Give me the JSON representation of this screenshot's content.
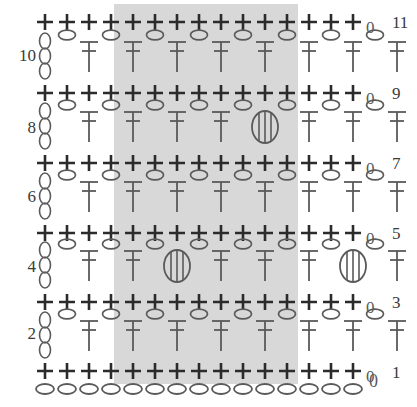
{
  "chart": {
    "type": "crochet-pattern-chart",
    "columns": 15,
    "rows_total": 11,
    "foundation_label": "0",
    "chain_end_label": "0",
    "repeat_band": {
      "x": 114,
      "y": 4,
      "width": 184,
      "height": 380,
      "color": "#d8d8d8",
      "meaning": "pattern repeat"
    },
    "row_labels_left": [
      {
        "label": "10",
        "x": 8,
        "y": 47
      },
      {
        "label": "8",
        "x": 8,
        "y": 119
      },
      {
        "label": "6",
        "x": 8,
        "y": 188
      },
      {
        "label": "4",
        "x": 8,
        "y": 258
      },
      {
        "label": "2",
        "x": 8,
        "y": 325
      }
    ],
    "row_labels_right": [
      {
        "label": "11",
        "x": 392,
        "y": 14
      },
      {
        "label": "9",
        "x": 392,
        "y": 85
      },
      {
        "label": "7",
        "x": 392,
        "y": 155
      },
      {
        "label": "5",
        "x": 392,
        "y": 225
      },
      {
        "label": "3",
        "x": 392,
        "y": 294
      },
      {
        "label": "1",
        "x": 392,
        "y": 364
      }
    ],
    "odd_rows": [
      {
        "number": 11,
        "y": 22,
        "symbol": "single-crochet",
        "count": 15,
        "turning_chain": "0"
      },
      {
        "number": 9,
        "y": 93,
        "symbol": "single-crochet",
        "count": 15,
        "turning_chain": "0"
      },
      {
        "number": 7,
        "y": 163,
        "symbol": "single-crochet",
        "count": 15,
        "turning_chain": "0"
      },
      {
        "number": 5,
        "y": 233,
        "symbol": "single-crochet",
        "count": 15,
        "turning_chain": "0"
      },
      {
        "number": 3,
        "y": 302,
        "symbol": "single-crochet",
        "count": 15,
        "turning_chain": "0"
      },
      {
        "number": 1,
        "y": 371,
        "symbol": "single-crochet",
        "count": 15,
        "turning_chain": "0"
      }
    ],
    "even_rows": [
      {
        "number": 10,
        "y": 57,
        "chain3_x": 50,
        "pairs": 7,
        "puffs": []
      },
      {
        "number": 8,
        "y": 127,
        "chain3_x": 50,
        "pairs": 7,
        "puffs": [
          4
        ]
      },
      {
        "number": 6,
        "y": 197,
        "chain3_x": 50,
        "pairs": 7,
        "puffs": []
      },
      {
        "number": 4,
        "y": 266,
        "chain3_x": 50,
        "pairs": 7,
        "puffs": [
          2,
          6
        ]
      },
      {
        "number": 2,
        "y": 336,
        "chain3_x": 50,
        "pairs": 7,
        "puffs": []
      }
    ],
    "foundation_row": {
      "y": 389,
      "count": 15,
      "symbol": "chain-stitch-oval",
      "end_label": "0"
    },
    "legend_symbols": [
      {
        "name": "single-crochet",
        "glyph": "+",
        "description": "single crochet (plus sign)"
      },
      {
        "name": "chain-stitch",
        "glyph": "oval",
        "description": "chain stitch (open oval)"
      },
      {
        "name": "double-crochet",
        "glyph": "T",
        "description": "double crochet (T with crossbar)"
      },
      {
        "name": "puff-stitch",
        "glyph": "bobble",
        "description": "puff / bobble stitch (oval with vertical ribs)"
      }
    ],
    "colors": {
      "ink": "#2b2b2b",
      "ink_light": "#5a5a5a",
      "shade": "#d8d8d8",
      "background": "#ffffff",
      "label": "#3a3a3a"
    },
    "geometry": {
      "col_start_x": 45,
      "col_step": 22.0,
      "plus_arm": 8,
      "oval_rx": 8,
      "oval_ry": 4.5,
      "dc_height": 30,
      "puff_rx": 13,
      "puff_ry": 16
    }
  }
}
